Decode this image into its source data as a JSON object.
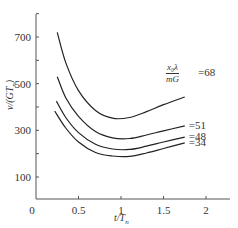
{
  "chart_data": {
    "type": "line",
    "title": "",
    "xlabel": "t/T_n",
    "ylabel": "v/(GT_n)",
    "xlim": [
      0,
      2.3
    ],
    "ylim": [
      10,
      800
    ],
    "grid": false,
    "x_ticks": [
      "0",
      "0.5",
      "1",
      "1.5",
      "2"
    ],
    "y_ticks": [
      "100",
      "300",
      "500",
      "700"
    ],
    "legend_title": "x0λ / mG",
    "series": [
      {
        "name": "68",
        "label": "=68",
        "points": [
          [
            0.25,
            720
          ],
          [
            0.35,
            590
          ],
          [
            0.5,
            470
          ],
          [
            0.7,
            385
          ],
          [
            0.9,
            352
          ],
          [
            1.1,
            355
          ],
          [
            1.3,
            380
          ],
          [
            1.5,
            410
          ],
          [
            1.75,
            443
          ]
        ]
      },
      {
        "name": "51",
        "label": "=51",
        "points": [
          [
            0.25,
            530
          ],
          [
            0.35,
            440
          ],
          [
            0.5,
            360
          ],
          [
            0.7,
            295
          ],
          [
            0.9,
            268
          ],
          [
            1.1,
            265
          ],
          [
            1.3,
            280
          ],
          [
            1.5,
            298
          ],
          [
            1.75,
            319
          ]
        ]
      },
      {
        "name": "48",
        "label": "=48",
        "points": [
          [
            0.24,
            425
          ],
          [
            0.35,
            355
          ],
          [
            0.5,
            290
          ],
          [
            0.7,
            240
          ],
          [
            0.9,
            220
          ],
          [
            1.1,
            218
          ],
          [
            1.3,
            232
          ],
          [
            1.5,
            250
          ],
          [
            1.75,
            271
          ]
        ]
      },
      {
        "name": "34",
        "label": "=34",
        "points": [
          [
            0.22,
            383
          ],
          [
            0.35,
            310
          ],
          [
            0.5,
            250
          ],
          [
            0.7,
            205
          ],
          [
            0.9,
            190
          ],
          [
            1.1,
            188
          ],
          [
            1.3,
            203
          ],
          [
            1.5,
            222
          ],
          [
            1.75,
            246
          ]
        ]
      }
    ]
  },
  "axis": {
    "x_label": "t/T",
    "x_label_sub": "n",
    "y_label": "v/(GT",
    "y_label_sub": "n",
    "y_label_end": ")",
    "origin": "0"
  },
  "legend": {
    "numerator": "x₀λ",
    "denominator": "mG",
    "first_value": "=68"
  }
}
